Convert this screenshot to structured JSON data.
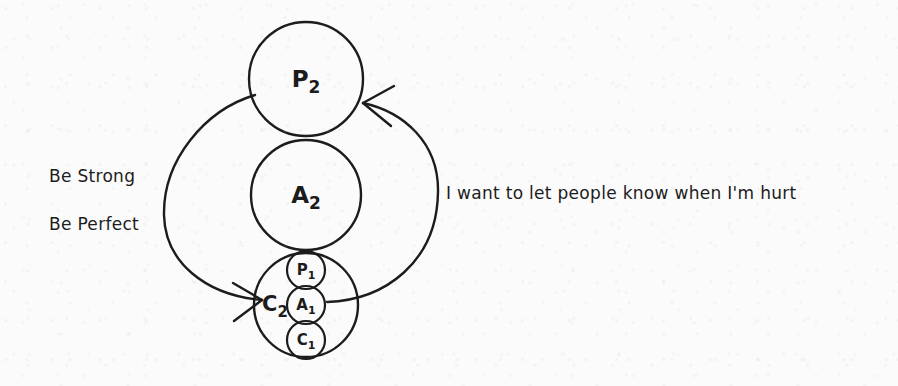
{
  "page": {
    "background_color": "#fbfbfb",
    "ink_color": "#1c1c1c",
    "width": 898,
    "height": 386
  },
  "diagram": {
    "type": "transactional-analysis-ego-state-diagram",
    "ego_states": [
      {
        "id": "P2",
        "label": "P",
        "subscript": "2",
        "full_label": "P2",
        "name": "Parent",
        "order": "second-order",
        "cx": 306,
        "cy": 79,
        "r": 57,
        "fill": "none",
        "stroke": "#1c1c1c",
        "stroke_width": 2.4
      },
      {
        "id": "A2",
        "label": "A",
        "subscript": "2",
        "full_label": "A2",
        "name": "Adult",
        "order": "second-order",
        "cx": 306,
        "cy": 195,
        "r": 55,
        "fill": "none",
        "stroke": "#1c1c1c",
        "stroke_width": 2.4
      },
      {
        "id": "C2",
        "label": "C",
        "subscript": "2",
        "full_label": "C2",
        "name": "Child",
        "order": "second-order",
        "cx": 306,
        "cy": 305,
        "r": 52,
        "fill": "none",
        "stroke": "#1c1c1c",
        "stroke_width": 2.4
      }
    ],
    "inner_ego_states": [
      {
        "id": "P1",
        "label": "P",
        "subscript": "1",
        "full_label": "P1",
        "name": "Parent in the Child",
        "parent": "C2",
        "cx": 306,
        "cy": 270,
        "r": 19,
        "fill": "none",
        "stroke": "#1c1c1c",
        "stroke_width": 2.2
      },
      {
        "id": "A1",
        "label": "A",
        "subscript": "1",
        "full_label": "A1",
        "name": "Adult in the Child",
        "parent": "C2",
        "cx": 306,
        "cy": 305,
        "r": 19,
        "fill": "none",
        "stroke": "#1c1c1c",
        "stroke_width": 2.2
      },
      {
        "id": "C1",
        "label": "C",
        "subscript": "1",
        "full_label": "C1",
        "name": "Child in the Child",
        "parent": "C2",
        "cx": 306,
        "cy": 340,
        "r": 19,
        "fill": "none",
        "stroke": "#1c1c1c",
        "stroke_width": 2.2
      }
    ],
    "c2_side_label": {
      "label": "C",
      "subscript": "2",
      "full_label": "C2",
      "x": 275,
      "y": 311
    },
    "arrows": [
      {
        "id": "arrow-parent-to-child",
        "name": "driver-message-arrow",
        "from": "P2",
        "to": "C2",
        "direction": "left-sweep",
        "annotation_ids": [
          "be-strong",
          "be-perfect"
        ],
        "stroke": "#1c1c1c",
        "stroke_width": 2.4,
        "path": "M 255 95 C 205 110, 163 160, 164 215 C 165 262, 205 295, 262 300",
        "head_tip": {
          "x": 262,
          "y": 300
        },
        "head_barbs": [
          {
            "x": 233,
            "y": 283
          },
          {
            "x": 234,
            "y": 321
          }
        ]
      },
      {
        "id": "arrow-child-adult-to-parent",
        "name": "permission-message-arrow",
        "from": "A1",
        "to": "P2",
        "direction": "right-sweep",
        "annotation_ids": [
          "permission"
        ],
        "stroke": "#1c1c1c",
        "stroke_width": 2.4,
        "path": "M 327 302 C 385 300, 437 262, 438 192 C 439 143, 404 112, 363 103",
        "head_tip": {
          "x": 363,
          "y": 103
        },
        "head_barbs": [
          {
            "x": 394,
            "y": 86
          },
          {
            "x": 391,
            "y": 126
          }
        ]
      }
    ],
    "annotations": [
      {
        "id": "be-strong",
        "text": "Be Strong",
        "side": "left",
        "kind": "driver"
      },
      {
        "id": "be-perfect",
        "text": "Be Perfect",
        "side": "left",
        "kind": "driver"
      },
      {
        "id": "permission",
        "text": "I want to let people know when I'm hurt",
        "side": "right",
        "kind": "permission"
      }
    ]
  }
}
